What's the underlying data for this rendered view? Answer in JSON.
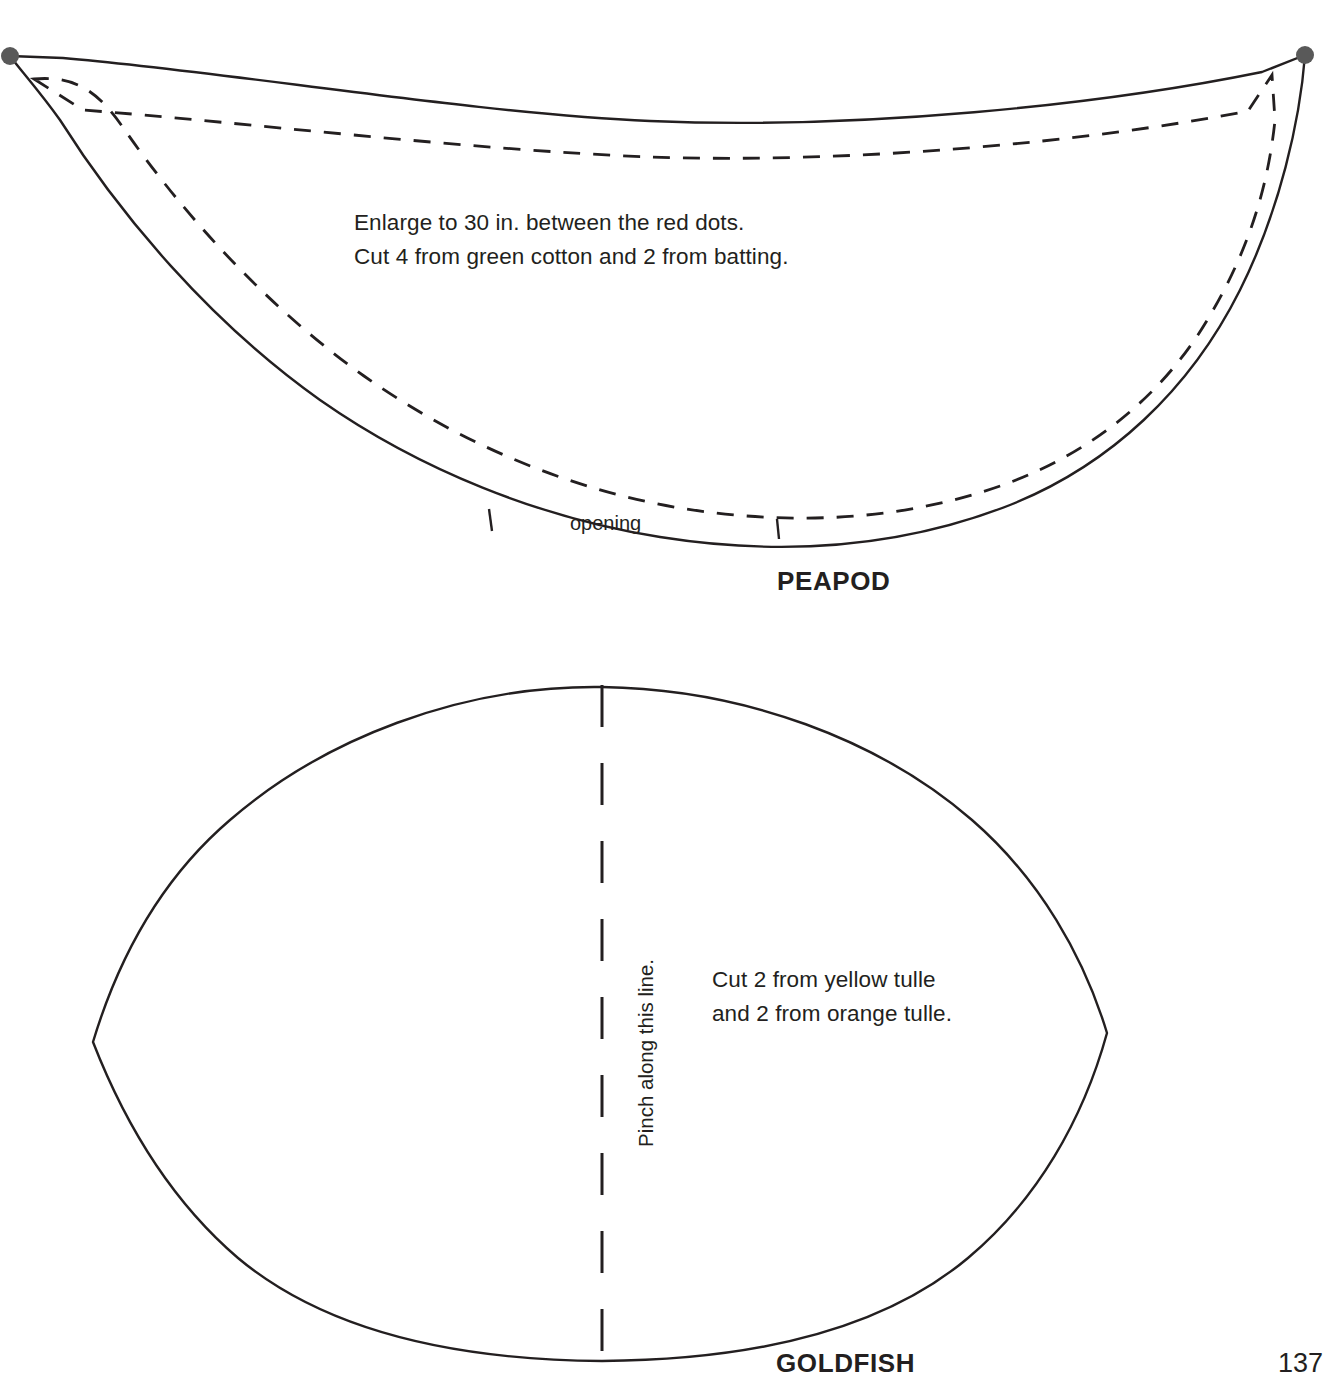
{
  "page": {
    "number": "137",
    "background_color": "#ffffff",
    "ink_color": "#231f20"
  },
  "patterns": [
    {
      "id": "peapod",
      "title": "PEAPOD",
      "instructions": [
        "Enlarge to 30 in. between the red dots.",
        "Cut 4 from green cotton and 2 from batting."
      ],
      "labels": {
        "opening": "opening"
      },
      "markers": {
        "dot_color": "#595959",
        "dot_count": 2,
        "dot_meaning": "red-dot-enlargement-reference"
      },
      "lines": {
        "cut_line": "solid",
        "seam_line": "dashed"
      }
    },
    {
      "id": "goldfish",
      "title": "GOLDFISH",
      "instructions": [
        "Cut 2 from yellow tulle",
        "and 2 from orange tulle."
      ],
      "labels": {
        "fold": "Pinch along this line."
      },
      "lines": {
        "cut_line": "solid",
        "fold_line": "dashed"
      }
    }
  ]
}
